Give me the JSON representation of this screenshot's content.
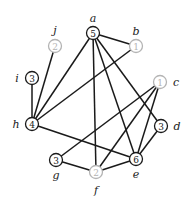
{
  "colors": {
    "dark": "#1a1a1a",
    "light": "#b4b4b4"
  },
  "nodes": [
    {
      "id": "a",
      "value": "5",
      "x": 93,
      "y": 33,
      "style": "dark",
      "lx": 93,
      "ly": 18
    },
    {
      "id": "b",
      "value": "1",
      "x": 136,
      "y": 46,
      "style": "light",
      "lx": 136,
      "ly": 31
    },
    {
      "id": "c",
      "value": "1",
      "x": 160,
      "y": 82,
      "style": "light",
      "lx": 176,
      "ly": 82
    },
    {
      "id": "d",
      "value": "3",
      "x": 161,
      "y": 126,
      "style": "dark",
      "lx": 177,
      "ly": 126
    },
    {
      "id": "e",
      "value": "6",
      "x": 136,
      "y": 159,
      "style": "dark",
      "lx": 136,
      "ly": 174
    },
    {
      "id": "f",
      "value": "2",
      "x": 96,
      "y": 172,
      "style": "light",
      "lx": 96,
      "ly": 190
    },
    {
      "id": "g",
      "value": "3",
      "x": 56,
      "y": 160,
      "style": "dark",
      "lx": 56,
      "ly": 175
    },
    {
      "id": "h",
      "value": "4",
      "x": 32,
      "y": 124,
      "style": "dark",
      "lx": 16,
      "ly": 124
    },
    {
      "id": "i",
      "value": "3",
      "x": 32,
      "y": 78,
      "style": "dark",
      "lx": 17,
      "ly": 78
    },
    {
      "id": "j",
      "value": "2",
      "x": 55,
      "y": 46,
      "style": "light",
      "lx": 55,
      "ly": 30
    }
  ],
  "edges": [
    [
      "a",
      "b"
    ],
    [
      "a",
      "h"
    ],
    [
      "a",
      "f"
    ],
    [
      "a",
      "e"
    ],
    [
      "a",
      "d"
    ],
    [
      "b",
      "h"
    ],
    [
      "j",
      "h"
    ],
    [
      "i",
      "h"
    ],
    [
      "h",
      "e"
    ],
    [
      "c",
      "g"
    ],
    [
      "c",
      "f"
    ],
    [
      "c",
      "e"
    ],
    [
      "d",
      "e"
    ],
    [
      "g",
      "f"
    ],
    [
      "f",
      "e"
    ]
  ]
}
